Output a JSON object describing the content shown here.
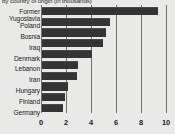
{
  "chart_data": {
    "type": "bar",
    "orientation": "horizontal",
    "title": "by country of origin (in thousands)",
    "xlabel": "",
    "ylabel": "",
    "categories": [
      "Former Yugoslavia",
      "Poland",
      "Bosnia",
      "Iraq",
      "Denmark",
      "Lebanon",
      "Iran",
      "Hungary",
      "Finland",
      "Germany"
    ],
    "category_lines": [
      [
        "Former",
        "Yugoslavia"
      ],
      [
        "Poland"
      ],
      [
        "Bosnia"
      ],
      [
        "Iraq"
      ],
      [
        "Denmark"
      ],
      [
        "Lebanon"
      ],
      [
        "Iran"
      ],
      [
        "Hungary"
      ],
      [
        "Finland"
      ],
      [
        "Germany"
      ]
    ],
    "values": [
      9.3,
      5.4,
      5.1,
      4.9,
      4.0,
      2.9,
      2.8,
      2.1,
      1.8,
      1.7
    ],
    "xlim": [
      0,
      10
    ],
    "xticks": [
      0,
      2,
      4,
      6,
      8,
      10
    ],
    "xtick_labels": [
      "0",
      "2",
      "4",
      "6",
      "8",
      "10"
    ],
    "grid": "vertical",
    "legend": null,
    "bar_color": "#343434",
    "grid_color": "#6f6f6f",
    "background_color": "#e9e9e7",
    "text_color": "#1c1c1c"
  }
}
